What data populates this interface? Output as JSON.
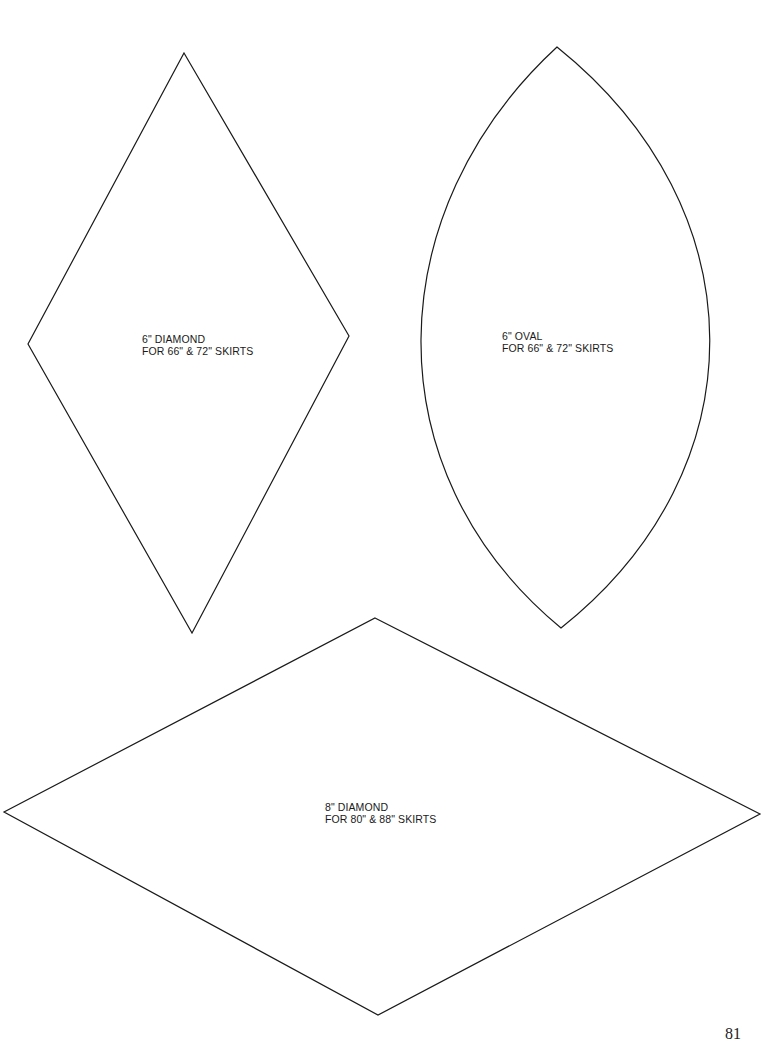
{
  "page": {
    "number": "81"
  },
  "templates": [
    {
      "id": "diamond-6",
      "shape": "diamond",
      "title": "6\" DIAMOND",
      "subtitle": "FOR 66\" & 72\" SKIRTS",
      "points": [
        [
          184,
          53
        ],
        [
          349,
          336
        ],
        [
          192,
          633
        ],
        [
          28,
          344
        ]
      ]
    },
    {
      "id": "oval-6",
      "shape": "oval",
      "title": "6\" OVAL",
      "subtitle": "FOR 66\" & 72\" SKIRTS",
      "top": [
        557,
        47
      ],
      "bottom": [
        561,
        628
      ]
    },
    {
      "id": "diamond-8",
      "shape": "diamond",
      "title": "8\" DIAMOND",
      "subtitle": "FOR 80\" & 88\" SKIRTS",
      "points": [
        [
          375,
          618
        ],
        [
          760,
          814
        ],
        [
          378,
          1015
        ],
        [
          4,
          812
        ]
      ]
    }
  ],
  "colors": {
    "line": "#1a1a1a",
    "background": "#ffffff"
  }
}
